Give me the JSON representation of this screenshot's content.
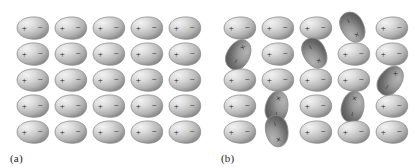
{
  "figure": {
    "background_color": "#ffffff",
    "ellipse_size": {
      "width": 34,
      "height": 24
    },
    "colors": {
      "outline": "#8a8a8a",
      "highlight": "#f2f2f2",
      "midtone": "#b4b4b4",
      "shadow": "#6b6b6b",
      "dark_shadow": "#4e4e4e",
      "sign_color": "#1c1c1c",
      "label_color": "#1a1a1a"
    }
  },
  "panels": [
    {
      "id": "a",
      "label": "(a)",
      "origin_x": 15,
      "origin_y": 16,
      "col_step": 38,
      "row_step": 26,
      "columns": 5,
      "rows": 5,
      "state": "aligned",
      "dipoles": [
        {
          "row": 0,
          "col": 0,
          "angle": 0,
          "plus": "+",
          "minus": "−",
          "shade": "light"
        },
        {
          "row": 0,
          "col": 1,
          "angle": 0,
          "plus": "+",
          "minus": "−",
          "shade": "light"
        },
        {
          "row": 0,
          "col": 2,
          "angle": 0,
          "plus": "+",
          "minus": "−",
          "shade": "light"
        },
        {
          "row": 0,
          "col": 3,
          "angle": 0,
          "plus": "+",
          "minus": "−",
          "shade": "light"
        },
        {
          "row": 0,
          "col": 4,
          "angle": 0,
          "plus": "+",
          "minus": "−",
          "shade": "light"
        },
        {
          "row": 1,
          "col": 0,
          "angle": 0,
          "plus": "+",
          "minus": "−",
          "shade": "light"
        },
        {
          "row": 1,
          "col": 1,
          "angle": 0,
          "plus": "+",
          "minus": "−",
          "shade": "light"
        },
        {
          "row": 1,
          "col": 2,
          "angle": 0,
          "plus": "+",
          "minus": "−",
          "shade": "light"
        },
        {
          "row": 1,
          "col": 3,
          "angle": 0,
          "plus": "+",
          "minus": "−",
          "shade": "light"
        },
        {
          "row": 1,
          "col": 4,
          "angle": 0,
          "plus": "+",
          "minus": "−",
          "shade": "light"
        },
        {
          "row": 2,
          "col": 0,
          "angle": 0,
          "plus": "+",
          "minus": "−",
          "shade": "light"
        },
        {
          "row": 2,
          "col": 1,
          "angle": 0,
          "plus": "+",
          "minus": "−",
          "shade": "light"
        },
        {
          "row": 2,
          "col": 2,
          "angle": 0,
          "plus": "+",
          "minus": "−",
          "shade": "light"
        },
        {
          "row": 2,
          "col": 3,
          "angle": 0,
          "plus": "+",
          "minus": "−",
          "shade": "light"
        },
        {
          "row": 2,
          "col": 4,
          "angle": 0,
          "plus": "+",
          "minus": "−",
          "shade": "light"
        },
        {
          "row": 3,
          "col": 0,
          "angle": 0,
          "plus": "+",
          "minus": "−",
          "shade": "light"
        },
        {
          "row": 3,
          "col": 1,
          "angle": 0,
          "plus": "+",
          "minus": "−",
          "shade": "light"
        },
        {
          "row": 3,
          "col": 2,
          "angle": 0,
          "plus": "+",
          "minus": "−",
          "shade": "light"
        },
        {
          "row": 3,
          "col": 3,
          "angle": 0,
          "plus": "+",
          "minus": "−",
          "shade": "light"
        },
        {
          "row": 3,
          "col": 4,
          "angle": 0,
          "plus": "+",
          "minus": "−",
          "shade": "light"
        },
        {
          "row": 4,
          "col": 0,
          "angle": 0,
          "plus": "+",
          "minus": "−",
          "shade": "light"
        },
        {
          "row": 4,
          "col": 1,
          "angle": 0,
          "plus": "+",
          "minus": "−",
          "shade": "light"
        },
        {
          "row": 4,
          "col": 2,
          "angle": 0,
          "plus": "+",
          "minus": "−",
          "shade": "light"
        },
        {
          "row": 4,
          "col": 3,
          "angle": 0,
          "plus": "+",
          "minus": "−",
          "shade": "light"
        },
        {
          "row": 4,
          "col": 4,
          "angle": 0,
          "plus": "+",
          "minus": "−",
          "shade": "light"
        }
      ]
    },
    {
      "id": "b",
      "label": "(b)",
      "origin_x": 15,
      "origin_y": 16,
      "col_step": 38,
      "row_step": 26,
      "columns": 5,
      "rows": 5,
      "state": "random",
      "dipoles": [
        {
          "row": 0,
          "col": 0,
          "angle": 0,
          "plus": "+",
          "minus": "−",
          "shade": "light"
        },
        {
          "row": 0,
          "col": 1,
          "angle": 0,
          "plus": "+",
          "minus": "−",
          "shade": "light"
        },
        {
          "row": 0,
          "col": 2,
          "angle": 0,
          "plus": "+",
          "minus": "−",
          "shade": "light"
        },
        {
          "row": 0,
          "col": 3,
          "angle": -119,
          "plus": "×",
          "minus": "−",
          "shade": "dark"
        },
        {
          "row": 0,
          "col": 4,
          "angle": 0,
          "plus": "+",
          "minus": "−",
          "shade": "light"
        },
        {
          "row": 1,
          "col": 0,
          "angle": 119,
          "plus": "×",
          "minus": "−",
          "shade": "dark"
        },
        {
          "row": 1,
          "col": 1,
          "angle": 0,
          "plus": "+",
          "minus": "−",
          "shade": "light"
        },
        {
          "row": 1,
          "col": 2,
          "angle": -119,
          "plus": "×",
          "minus": "−",
          "shade": "dark"
        },
        {
          "row": 1,
          "col": 3,
          "angle": 0,
          "plus": "+",
          "minus": "−",
          "shade": "light"
        },
        {
          "row": 1,
          "col": 4,
          "angle": 0,
          "plus": "+",
          "minus": "−",
          "shade": "light"
        },
        {
          "row": 2,
          "col": 0,
          "angle": 0,
          "plus": "+",
          "minus": "−",
          "shade": "light"
        },
        {
          "row": 2,
          "col": 1,
          "angle": 0,
          "plus": "+",
          "minus": "−",
          "shade": "light"
        },
        {
          "row": 2,
          "col": 2,
          "angle": 0,
          "plus": "+",
          "minus": "−",
          "shade": "light"
        },
        {
          "row": 2,
          "col": 3,
          "angle": 0,
          "plus": "+",
          "minus": "−",
          "shade": "light"
        },
        {
          "row": 2,
          "col": 4,
          "angle": 125,
          "plus": "×",
          "minus": "−",
          "shade": "dark"
        },
        {
          "row": 3,
          "col": 0,
          "angle": 0,
          "plus": "+",
          "minus": "−",
          "shade": "light"
        },
        {
          "row": 3,
          "col": 1,
          "angle": 101,
          "plus": "×",
          "minus": "−",
          "shade": "dark"
        },
        {
          "row": 3,
          "col": 2,
          "angle": 0,
          "plus": "+",
          "minus": "−",
          "shade": "light"
        },
        {
          "row": 3,
          "col": 3,
          "angle": 101,
          "plus": "×",
          "minus": "−",
          "shade": "dark"
        },
        {
          "row": 3,
          "col": 4,
          "angle": 0,
          "plus": "+",
          "minus": "−",
          "shade": "light"
        },
        {
          "row": 4,
          "col": 0,
          "angle": 0,
          "plus": "+",
          "minus": "−",
          "shade": "light"
        },
        {
          "row": 4,
          "col": 1,
          "angle": -101,
          "plus": "×",
          "minus": "−",
          "shade": "dark"
        },
        {
          "row": 4,
          "col": 2,
          "angle": 0,
          "plus": "+",
          "minus": "−",
          "shade": "light"
        },
        {
          "row": 4,
          "col": 3,
          "angle": 0,
          "plus": "+",
          "minus": "−",
          "shade": "light"
        },
        {
          "row": 4,
          "col": 4,
          "angle": 0,
          "plus": "+",
          "minus": "−",
          "shade": "light"
        }
      ]
    }
  ]
}
